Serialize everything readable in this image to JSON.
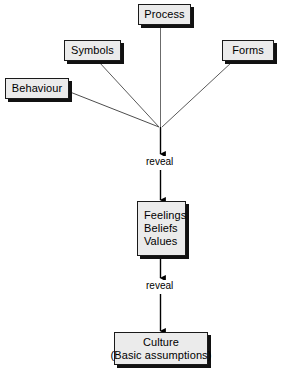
{
  "diagram": {
    "background_color": "#ffffff",
    "node_fill_color": "#ebebeb",
    "node_border_color": "#1a1a1a",
    "node_shadow_color": "#111111",
    "connector_color": "#4d4d4d",
    "arrow_color": "#000000",
    "nodes": [
      {
        "id": "process",
        "label": "Process",
        "lines": [
          "Process"
        ]
      },
      {
        "id": "symbols",
        "label": "Symbols",
        "lines": [
          "Symbols"
        ]
      },
      {
        "id": "forms",
        "label": "Forms",
        "lines": [
          "Forms"
        ]
      },
      {
        "id": "behaviour",
        "label": "Behaviour",
        "lines": [
          "Behaviour"
        ]
      },
      {
        "id": "feelings",
        "label": "Feelings Beliefs Values",
        "lines": [
          "Feelings",
          "Beliefs",
          "Values"
        ]
      },
      {
        "id": "culture",
        "label": "Culture (Basic assumptions)",
        "lines": [
          "Culture",
          "(Basic assumptions)"
        ]
      }
    ],
    "edge_labels": [
      {
        "id": "reveal-1",
        "text": "reveal"
      },
      {
        "id": "reveal-2",
        "text": "reveal"
      }
    ],
    "connections": [
      {
        "from": "process",
        "to": "junction"
      },
      {
        "from": "symbols",
        "to": "junction"
      },
      {
        "from": "forms",
        "to": "junction"
      },
      {
        "from": "behaviour",
        "to": "junction"
      },
      {
        "from": "junction",
        "to": "feelings",
        "label": "reveal"
      },
      {
        "from": "feelings",
        "to": "culture",
        "label": "reveal"
      }
    ]
  },
  "nodes": {
    "process": {
      "line1": "Process"
    },
    "symbols": {
      "line1": "Symbols"
    },
    "forms": {
      "line1": "Forms"
    },
    "behaviour": {
      "line1": "Behaviour"
    },
    "feelings": {
      "line1": "Feelings",
      "line2": "Beliefs",
      "line3": "Values"
    },
    "culture": {
      "line1": "Culture",
      "line2": "(Basic assumptions)"
    }
  },
  "labels": {
    "reveal_1": "reveal",
    "reveal_2": "reveal"
  }
}
